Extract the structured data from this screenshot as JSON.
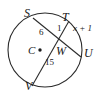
{
  "figure": {
    "type": "circle-with-two-intersecting-chords",
    "stroke_color": "#2b2b2b",
    "background_color": "#ffffff",
    "circle": {
      "cx": 45,
      "cy": 50,
      "r": 37
    },
    "center_point": {
      "label": "C",
      "x": 45,
      "y": 50
    },
    "intersection_point": {
      "label": "W",
      "x": 62,
      "y": 44
    },
    "points": [
      {
        "name": "S",
        "label": "S",
        "x": 33,
        "y": 18
      },
      {
        "name": "T",
        "label": "T",
        "x": 69,
        "y": 21
      },
      {
        "name": "U",
        "label": "U",
        "x": 81,
        "y": 57
      },
      {
        "name": "V",
        "label": "V",
        "x": 32,
        "y": 86
      },
      {
        "name": "W",
        "label": "W",
        "x": 62,
        "y": 44
      },
      {
        "name": "C",
        "label": "C",
        "x": 45,
        "y": 50
      }
    ],
    "chords": [
      {
        "name": "chord-SU",
        "from": "S",
        "to": "U"
      },
      {
        "name": "chord-TV",
        "from": "T",
        "to": "V"
      }
    ],
    "segments": [
      {
        "name": "segment-SW",
        "from": "S",
        "to": "W",
        "measure": "6"
      },
      {
        "name": "segment-WU",
        "from": "W",
        "to": "U",
        "measure": "x + 1"
      },
      {
        "name": "segment-TW",
        "from": "T",
        "to": "W",
        "measure": "1"
      },
      {
        "name": "segment-WV",
        "from": "W",
        "to": "V",
        "measure": "15"
      }
    ],
    "labels": {
      "S": "S",
      "T": "T",
      "U": "U",
      "V": "V",
      "W": "W",
      "C": "C",
      "SW": "6",
      "TW": "1",
      "WV": "15",
      "WU": "x + 1"
    }
  }
}
